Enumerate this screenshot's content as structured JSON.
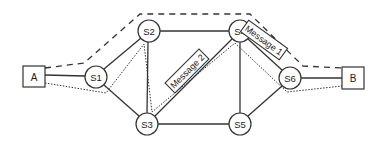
{
  "diagram": {
    "title": "",
    "endpoints": [
      {
        "id": "A",
        "label": "A",
        "x": 34,
        "y": 77
      },
      {
        "id": "B",
        "label": "B",
        "x": 353,
        "y": 78
      }
    ],
    "switches": [
      {
        "id": "S1",
        "label": "S1",
        "x": 96,
        "y": 77
      },
      {
        "id": "S2",
        "label": "S2",
        "x": 149,
        "y": 31
      },
      {
        "id": "S3",
        "label": "S3",
        "x": 147,
        "y": 124
      },
      {
        "id": "S4",
        "label": "S4",
        "x": 240,
        "y": 31
      },
      {
        "id": "S5",
        "label": "S5",
        "x": 240,
        "y": 124
      },
      {
        "id": "S6",
        "label": "S6",
        "x": 290,
        "y": 78
      }
    ],
    "links": [
      [
        "A",
        "S1"
      ],
      [
        "S1",
        "S2"
      ],
      [
        "S1",
        "S3"
      ],
      [
        "S2",
        "S3"
      ],
      [
        "S2",
        "S4"
      ],
      [
        "S3",
        "S4"
      ],
      [
        "S3",
        "S5"
      ],
      [
        "S4",
        "S5"
      ],
      [
        "S4",
        "S6"
      ],
      [
        "S5",
        "S6"
      ],
      [
        "S6",
        "B"
      ]
    ],
    "messages": [
      {
        "id": "message-1",
        "label": "Message 1",
        "style": "dashed",
        "route": [
          "A",
          "S2",
          "S4",
          "B"
        ]
      },
      {
        "id": "message-2",
        "label": "Message 2",
        "style": "dotted",
        "route": [
          "A",
          "S1",
          "S2",
          "S3",
          "S4",
          "S6",
          "B"
        ]
      }
    ],
    "colors": {
      "stroke": "#333333",
      "background": "#ffffff",
      "text": "#222222"
    }
  }
}
